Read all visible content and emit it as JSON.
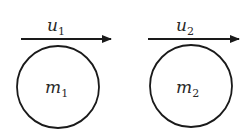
{
  "diagram": {
    "bodies": [
      {
        "mass_label": "m",
        "mass_sub": "1",
        "velocity_label": "u",
        "velocity_sub": "1"
      },
      {
        "mass_label": "m",
        "mass_sub": "2",
        "velocity_label": "u",
        "velocity_sub": "2"
      }
    ],
    "colors": {
      "stroke": "#1a1a1a",
      "text": "#2a2a2a",
      "background": "#ffffff"
    }
  }
}
